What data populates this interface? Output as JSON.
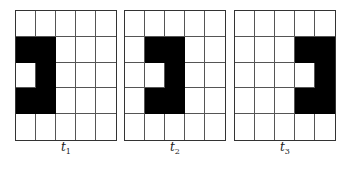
{
  "figure": {
    "rows": 5,
    "cols": 5,
    "colors": {
      "filled": "#000000",
      "empty": "#ffffff",
      "grid_line": "#555555"
    },
    "panels": [
      {
        "label": "t",
        "subscript": "1",
        "filled_cells": [
          [
            1,
            0
          ],
          [
            1,
            1
          ],
          [
            2,
            1
          ],
          [
            3,
            0
          ],
          [
            3,
            1
          ]
        ]
      },
      {
        "label": "t",
        "subscript": "2",
        "filled_cells": [
          [
            1,
            1
          ],
          [
            1,
            2
          ],
          [
            2,
            2
          ],
          [
            3,
            1
          ],
          [
            3,
            2
          ]
        ]
      },
      {
        "label": "t",
        "subscript": "3",
        "filled_cells": [
          [
            1,
            3
          ],
          [
            1,
            4
          ],
          [
            2,
            4
          ],
          [
            3,
            3
          ],
          [
            3,
            4
          ]
        ]
      }
    ]
  }
}
